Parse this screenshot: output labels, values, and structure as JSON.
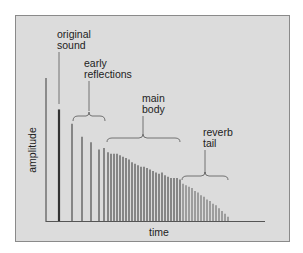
{
  "diagram": {
    "type": "impulse_response_reverb",
    "axis": {
      "x_label": "time",
      "y_label": "amplitude"
    },
    "annotations": [
      {
        "id": "original_sound",
        "lines": [
          "original",
          "sound"
        ]
      },
      {
        "id": "early_reflections",
        "lines": [
          "early",
          "reflections"
        ]
      },
      {
        "id": "main_body",
        "lines": [
          "main",
          "body"
        ]
      },
      {
        "id": "reverb_tail",
        "lines": [
          "reverb",
          "tail"
        ]
      }
    ],
    "colors": {
      "background": "#dcdcdc",
      "frame": "#8a8a8a",
      "axis": "#555555",
      "original_bar": "#333333",
      "bars": "#6a6a6a",
      "text": "#222222"
    }
  },
  "chart_data": {
    "type": "bar",
    "title": "",
    "xlabel": "time",
    "ylabel": "amplitude",
    "grid": false,
    "note": "Relative amplitudes (0-100 scale, y-axis top = 100) of impulse response spikes over time; no numeric ticks shown",
    "series": [
      {
        "name": "original sound",
        "x": [
          59
        ],
        "values": [
          78
        ]
      },
      {
        "name": "early reflections",
        "x": [
          72,
          82,
          91,
          99
        ],
        "values": [
          68,
          59,
          55,
          50
        ]
      },
      {
        "name": "main body",
        "x": [
          104,
          108,
          111,
          114,
          117,
          120,
          123,
          126,
          129,
          132,
          135,
          138,
          141,
          144,
          147,
          150,
          153,
          156,
          159,
          162,
          165,
          168,
          171,
          174,
          177,
          180
        ],
        "values": [
          51,
          48,
          47,
          47,
          47,
          46,
          45,
          44,
          43,
          41,
          40,
          39,
          38,
          38,
          37,
          36,
          35,
          34,
          33,
          34,
          32,
          31,
          30,
          30,
          30,
          29
        ]
      },
      {
        "name": "reverb tail",
        "x": [
          183,
          186,
          189,
          192,
          195,
          198,
          201,
          204,
          207,
          210,
          213,
          216,
          219,
          222,
          225,
          228
        ],
        "values": [
          26,
          25,
          24,
          23,
          21,
          20,
          18,
          17,
          15,
          14,
          12,
          11,
          9,
          7,
          5,
          3
        ]
      }
    ]
  }
}
